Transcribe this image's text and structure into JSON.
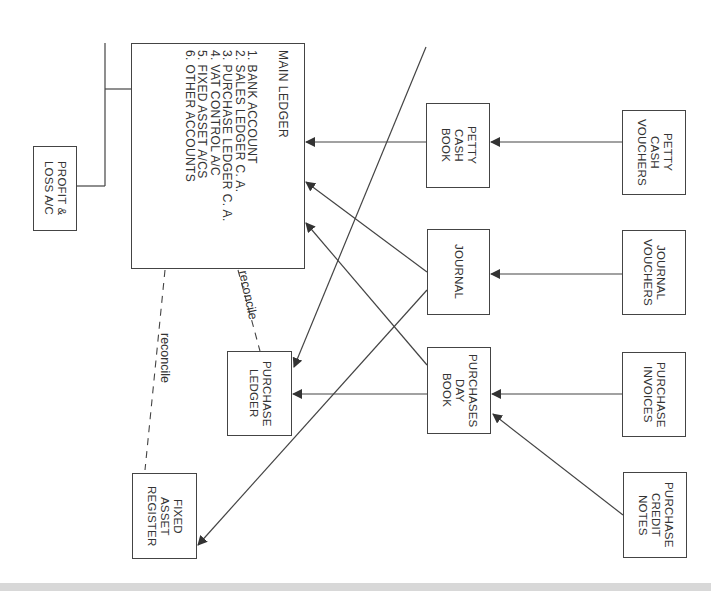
{
  "diagram": {
    "type": "accounting-flow",
    "orientation": "rotated-90-clockwise",
    "nodes": {
      "main_ledger": {
        "title": "MAIN LEDGER",
        "items": [
          "1. BANK ACCOUNT",
          "2. SALES LEDGER C. A.",
          "3. PURCHASE LEDGER C. A.",
          "4. VAT CONTROL A/C",
          "5. FIXED ASSET A/CS",
          "6. OTHER ACCOUNTS"
        ]
      },
      "profit_loss": {
        "label": "PROFIT &\nLOSS A/C"
      },
      "petty_cash_book": {
        "label": "PETTY\nCASH\nBOOK"
      },
      "journal": {
        "label": "JOURNAL"
      },
      "purchases_day_book": {
        "label": "PURCHASES\nDAY\nBOOK"
      },
      "purchase_ledger": {
        "label": "PURCHASE\nLEDGER"
      },
      "fixed_asset_register": {
        "label": "FIXED\nASSET\nREGISTER"
      },
      "petty_cash_vouchers": {
        "label": "PETTY\nCASH\nVOUCHERS"
      },
      "journal_vouchers": {
        "label": "JOURNAL\nVOUCHERS"
      },
      "purchase_invoices": {
        "label": "PURCHASE\nINVOICES"
      },
      "purchase_credit_notes": {
        "label": "PURCHASE\nCREDIT\nNOTES"
      }
    },
    "annotations": {
      "reconcile_1": "reconcile",
      "reconcile_2": "reconcile"
    },
    "edges": [
      {
        "from": "petty_cash_vouchers",
        "to": "petty_cash_book",
        "style": "arrow"
      },
      {
        "from": "journal_vouchers",
        "to": "journal",
        "style": "arrow"
      },
      {
        "from": "purchase_invoices",
        "to": "purchases_day_book",
        "style": "arrow"
      },
      {
        "from": "purchase_credit_notes",
        "to": "purchases_day_book",
        "style": "arrow"
      },
      {
        "from": "petty_cash_book",
        "to": "main_ledger",
        "style": "arrow"
      },
      {
        "from": "journal",
        "to": "main_ledger",
        "style": "arrow"
      },
      {
        "from": "purchases_day_book",
        "to": "main_ledger",
        "style": "arrow"
      },
      {
        "from": "purchases_day_book",
        "to": "purchase_ledger",
        "style": "arrow"
      },
      {
        "from": "journal",
        "to": "fixed_asset_register",
        "style": "arrow"
      },
      {
        "from": "petty_cash_book_area",
        "to": "purchase_ledger",
        "style": "arrow"
      },
      {
        "from": "main_ledger",
        "to": "profit_loss",
        "style": "line"
      },
      {
        "from": "main_ledger",
        "to": "purchase_ledger",
        "style": "dashed",
        "label": "reconcile"
      },
      {
        "from": "main_ledger",
        "to": "fixed_asset_register",
        "style": "dashed",
        "label": "reconcile"
      }
    ],
    "colors": {
      "stroke": "#444444",
      "text": "#333333",
      "background": "#ffffff",
      "band": "#d8d8d8"
    }
  }
}
